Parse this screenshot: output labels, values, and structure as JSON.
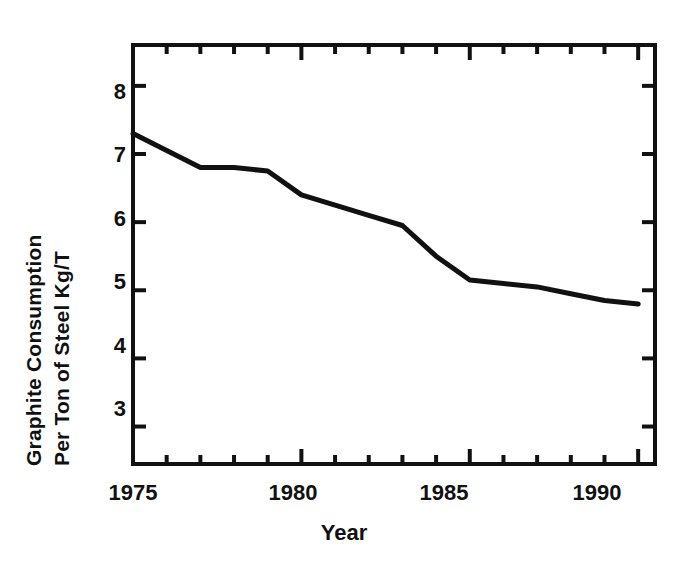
{
  "chart_data": {
    "type": "line",
    "title": "",
    "xlabel": "Year",
    "ylabel": "Graphite Consumption Per Ton of Steel Kg/T",
    "ylabel_line1": "Graphite Consumption",
    "ylabel_line2": "Per Ton of Steel Kg/T",
    "x": [
      1975,
      1976,
      1977,
      1978,
      1979,
      1980,
      1981,
      1982,
      1983,
      1984,
      1985,
      1986,
      1987,
      1988,
      1989,
      1990
    ],
    "values": [
      7.3,
      7.05,
      6.8,
      6.8,
      6.75,
      6.4,
      6.25,
      6.1,
      5.95,
      5.5,
      5.15,
      5.1,
      5.05,
      4.95,
      4.85,
      4.8
    ],
    "series": [
      {
        "name": "Graphite Consumption Per Ton of Steel",
        "values": [
          7.3,
          7.05,
          6.8,
          6.8,
          6.75,
          6.4,
          6.25,
          6.1,
          5.95,
          5.5,
          5.15,
          5.1,
          5.05,
          4.95,
          4.85,
          4.8
        ]
      }
    ],
    "xlim": [
      1975,
      1990.5
    ],
    "ylim": [
      2.45,
      8.6
    ],
    "ytick_labels": [
      "8",
      "7",
      "6",
      "5",
      "4",
      "3"
    ],
    "ytick_values": [
      8,
      7,
      6,
      5,
      4,
      3
    ],
    "xtick_labels": [
      "1975",
      "1980",
      "1985",
      "1990"
    ],
    "xtick_values": [
      1975,
      1980,
      1985,
      1990
    ],
    "xminor_step": 1,
    "grid": false,
    "legend": false,
    "line_color": "#111111",
    "axis_color": "#111111",
    "background": "#ffffff"
  },
  "axis_ticks": {
    "y_major": [
      8,
      7,
      6,
      5,
      4,
      3
    ],
    "x_major": [
      1975,
      1980,
      1985,
      1990
    ],
    "x_minor": [
      1976,
      1977,
      1978,
      1979,
      1981,
      1982,
      1983,
      1984,
      1986,
      1987,
      1988,
      1989
    ]
  }
}
